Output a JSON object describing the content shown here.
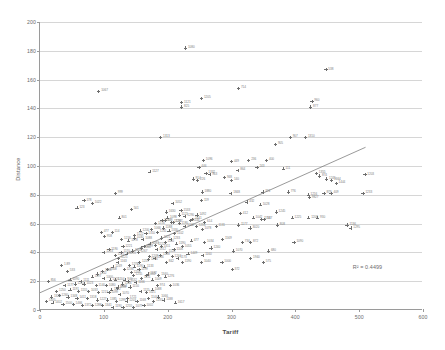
{
  "chart_data": {
    "type": "scatter",
    "title": "",
    "xlabel": "Tariff",
    "ylabel": "Distance",
    "xlim": [
      0,
      600
    ],
    "ylim": [
      0,
      200
    ],
    "xticks": [
      0,
      100,
      200,
      300,
      400,
      500,
      600
    ],
    "yticks": [
      0,
      20,
      40,
      60,
      80,
      100,
      120,
      140,
      160,
      180,
      200
    ],
    "grid": "horizontal",
    "legend": "none",
    "annotations": [
      {
        "name": "r-squared",
        "text": "R² = 0.4499",
        "x": 490,
        "y": 32
      }
    ],
    "trendline": {
      "type": "linear",
      "x0": 0,
      "y0": 12,
      "x1": 510,
      "y1": 113,
      "color": "#6e6e6e"
    },
    "marker": {
      "shape": "plus",
      "color": "#6e6e6e",
      "size": 3.2
    },
    "point_labels_visible": true,
    "points": [
      {
        "x": 228,
        "y": 182,
        "label": "1080"
      },
      {
        "x": 448,
        "y": 167,
        "label": "538"
      },
      {
        "x": 92,
        "y": 152,
        "label": "1067"
      },
      {
        "x": 311,
        "y": 154,
        "label": "714"
      },
      {
        "x": 426,
        "y": 145,
        "label": "960"
      },
      {
        "x": 424,
        "y": 141,
        "label": "877"
      },
      {
        "x": 253,
        "y": 147,
        "label": "1205"
      },
      {
        "x": 222,
        "y": 144,
        "label": "1121"
      },
      {
        "x": 222,
        "y": 141,
        "label": "825"
      },
      {
        "x": 189,
        "y": 120,
        "label": "1313"
      },
      {
        "x": 392,
        "y": 120,
        "label": "907"
      },
      {
        "x": 416,
        "y": 120,
        "label": "1310"
      },
      {
        "x": 369,
        "y": 115,
        "label": "905"
      },
      {
        "x": 256,
        "y": 104,
        "label": "1096"
      },
      {
        "x": 300,
        "y": 103,
        "label": "449"
      },
      {
        "x": 327,
        "y": 104,
        "label": "236"
      },
      {
        "x": 355,
        "y": 104,
        "label": "400"
      },
      {
        "x": 172,
        "y": 96,
        "label": "1127"
      },
      {
        "x": 249,
        "y": 99,
        "label": "446"
      },
      {
        "x": 310,
        "y": 97,
        "label": "864"
      },
      {
        "x": 340,
        "y": 99,
        "label": "243"
      },
      {
        "x": 381,
        "y": 98,
        "label": "111"
      },
      {
        "x": 260,
        "y": 95,
        "label": "1332"
      },
      {
        "x": 266,
        "y": 94,
        "label": "963"
      },
      {
        "x": 289,
        "y": 92,
        "label": "948"
      },
      {
        "x": 240,
        "y": 91,
        "label": "914"
      },
      {
        "x": 247,
        "y": 90,
        "label": "226"
      },
      {
        "x": 300,
        "y": 90,
        "label": "140"
      },
      {
        "x": 433,
        "y": 95,
        "label": "1355"
      },
      {
        "x": 438,
        "y": 93,
        "label": "874"
      },
      {
        "x": 449,
        "y": 91,
        "label": "1245"
      },
      {
        "x": 457,
        "y": 90,
        "label": "1664"
      },
      {
        "x": 464,
        "y": 88,
        "label": "1444"
      },
      {
        "x": 509,
        "y": 94,
        "label": "1203"
      },
      {
        "x": 118,
        "y": 81,
        "label": "999"
      },
      {
        "x": 254,
        "y": 82,
        "label": "1880"
      },
      {
        "x": 299,
        "y": 81,
        "label": "1848"
      },
      {
        "x": 349,
        "y": 82,
        "label": "374"
      },
      {
        "x": 389,
        "y": 82,
        "label": "776"
      },
      {
        "x": 420,
        "y": 80,
        "label": "1216"
      },
      {
        "x": 445,
        "y": 81,
        "label": "879"
      },
      {
        "x": 456,
        "y": 81,
        "label": "409"
      },
      {
        "x": 422,
        "y": 78,
        "label": "9827"
      },
      {
        "x": 506,
        "y": 81,
        "label": "1233"
      },
      {
        "x": 69,
        "y": 76,
        "label": "178"
      },
      {
        "x": 82,
        "y": 74,
        "label": "1022"
      },
      {
        "x": 58,
        "y": 71,
        "label": "123"
      },
      {
        "x": 208,
        "y": 74,
        "label": "1052"
      },
      {
        "x": 253,
        "y": 76,
        "label": "119"
      },
      {
        "x": 324,
        "y": 75,
        "label": "432"
      },
      {
        "x": 345,
        "y": 73,
        "label": "1028"
      },
      {
        "x": 143,
        "y": 70,
        "label": "501"
      },
      {
        "x": 198,
        "y": 68,
        "label": "1630"
      },
      {
        "x": 221,
        "y": 69,
        "label": "1533"
      },
      {
        "x": 246,
        "y": 66,
        "label": "1492"
      },
      {
        "x": 314,
        "y": 67,
        "label": "412"
      },
      {
        "x": 370,
        "y": 68,
        "label": "1245"
      },
      {
        "x": 124,
        "y": 64,
        "label": "801"
      },
      {
        "x": 196,
        "y": 62,
        "label": "478"
      },
      {
        "x": 206,
        "y": 61,
        "label": "1226"
      },
      {
        "x": 239,
        "y": 63,
        "label": "1441"
      },
      {
        "x": 258,
        "y": 61,
        "label": "614"
      },
      {
        "x": 334,
        "y": 64,
        "label": "1042"
      },
      {
        "x": 347,
        "y": 63,
        "label": "1134"
      },
      {
        "x": 352,
        "y": 63,
        "label": "537"
      },
      {
        "x": 395,
        "y": 64,
        "label": "1225"
      },
      {
        "x": 421,
        "y": 64,
        "label": "1208"
      },
      {
        "x": 435,
        "y": 64,
        "label": "930"
      },
      {
        "x": 276,
        "y": 58,
        "label": "1131"
      },
      {
        "x": 311,
        "y": 59,
        "label": "1177"
      },
      {
        "x": 329,
        "y": 57,
        "label": "3020"
      },
      {
        "x": 372,
        "y": 59,
        "label": "808"
      },
      {
        "x": 481,
        "y": 59,
        "label": "1136"
      },
      {
        "x": 487,
        "y": 57,
        "label": "1295"
      },
      {
        "x": 96,
        "y": 54,
        "label": "477"
      },
      {
        "x": 113,
        "y": 54,
        "label": "114"
      },
      {
        "x": 101,
        "y": 51,
        "label": "958"
      },
      {
        "x": 128,
        "y": 49,
        "label": "1216"
      },
      {
        "x": 148,
        "y": 50,
        "label": "1030"
      },
      {
        "x": 161,
        "y": 49,
        "label": "1088"
      },
      {
        "x": 190,
        "y": 50,
        "label": "1221"
      },
      {
        "x": 237,
        "y": 48,
        "label": "477"
      },
      {
        "x": 258,
        "y": 47,
        "label": "1034"
      },
      {
        "x": 286,
        "y": 49,
        "label": "1569"
      },
      {
        "x": 317,
        "y": 47,
        "label": "734"
      },
      {
        "x": 330,
        "y": 47,
        "label": "872"
      },
      {
        "x": 398,
        "y": 47,
        "label": "1090"
      },
      {
        "x": 130,
        "y": 44,
        "label": "1221"
      },
      {
        "x": 159,
        "y": 43,
        "label": "1060"
      },
      {
        "x": 183,
        "y": 42,
        "label": "1312"
      },
      {
        "x": 210,
        "y": 42,
        "label": "1106"
      },
      {
        "x": 268,
        "y": 43,
        "label": "1240"
      },
      {
        "x": 303,
        "y": 41,
        "label": "1070"
      },
      {
        "x": 358,
        "y": 41,
        "label": "680"
      },
      {
        "x": 232,
        "y": 39,
        "label": "1449"
      },
      {
        "x": 255,
        "y": 38,
        "label": "1160"
      },
      {
        "x": 330,
        "y": 36,
        "label": "1940"
      },
      {
        "x": 123,
        "y": 36,
        "label": "1125"
      },
      {
        "x": 170,
        "y": 35,
        "label": "1216"
      },
      {
        "x": 198,
        "y": 33,
        "label": "842"
      },
      {
        "x": 223,
        "y": 33,
        "label": "1190"
      },
      {
        "x": 253,
        "y": 33,
        "label": "1040"
      },
      {
        "x": 285,
        "y": 33,
        "label": "1000"
      },
      {
        "x": 350,
        "y": 33,
        "label": "575"
      },
      {
        "x": 301,
        "y": 28,
        "label": "372"
      },
      {
        "x": 143,
        "y": 26,
        "label": "1209"
      },
      {
        "x": 169,
        "y": 25,
        "label": "1182"
      },
      {
        "x": 196,
        "y": 23,
        "label": "1276"
      },
      {
        "x": 204,
        "y": 17,
        "label": "1036"
      },
      {
        "x": 137,
        "y": 8,
        "label": "1721"
      },
      {
        "x": 212,
        "y": 5,
        "label": "1617"
      },
      {
        "x": 34,
        "y": 31,
        "label": "1.89"
      },
      {
        "x": 43,
        "y": 27,
        "label": "533"
      },
      {
        "x": 13,
        "y": 20,
        "label": "856"
      },
      {
        "x": 100,
        "y": 22,
        "label": "1000"
      },
      {
        "x": 110,
        "y": 21,
        "label": "1120"
      },
      {
        "x": 118,
        "y": 21,
        "label": "1204"
      },
      {
        "x": 133,
        "y": 21,
        "label": "940"
      },
      {
        "x": 69,
        "y": 18,
        "label": "1023"
      },
      {
        "x": 88,
        "y": 17,
        "label": "1140"
      },
      {
        "x": 104,
        "y": 17,
        "label": "1080"
      },
      {
        "x": 122,
        "y": 16,
        "label": "1244"
      },
      {
        "x": 141,
        "y": 16,
        "label": "1150"
      },
      {
        "x": 47,
        "y": 14,
        "label": "1191"
      },
      {
        "x": 60,
        "y": 13,
        "label": "1155"
      },
      {
        "x": 76,
        "y": 13,
        "label": "1033"
      },
      {
        "x": 92,
        "y": 12,
        "label": "1213"
      },
      {
        "x": 108,
        "y": 12,
        "label": "1099"
      },
      {
        "x": 125,
        "y": 11,
        "label": "1070"
      },
      {
        "x": 30,
        "y": 10,
        "label": "1260"
      },
      {
        "x": 44,
        "y": 9,
        "label": "1348"
      },
      {
        "x": 58,
        "y": 8,
        "label": "1411"
      },
      {
        "x": 74,
        "y": 8,
        "label": "1318"
      },
      {
        "x": 90,
        "y": 7,
        "label": "1227"
      },
      {
        "x": 106,
        "y": 7,
        "label": "1385"
      },
      {
        "x": 120,
        "y": 6,
        "label": "1299"
      },
      {
        "x": 136,
        "y": 6,
        "label": "1203"
      },
      {
        "x": 152,
        "y": 6,
        "label": "1168"
      },
      {
        "x": 20,
        "y": 5,
        "label": "1402"
      },
      {
        "x": 36,
        "y": 4,
        "label": "1500"
      },
      {
        "x": 52,
        "y": 4,
        "label": "1466"
      },
      {
        "x": 66,
        "y": 3,
        "label": "1372"
      },
      {
        "x": 82,
        "y": 3,
        "label": "1288"
      },
      {
        "x": 98,
        "y": 3,
        "label": "1341"
      },
      {
        "x": 114,
        "y": 2,
        "label": "1190"
      },
      {
        "x": 130,
        "y": 2,
        "label": "1255"
      },
      {
        "x": 146,
        "y": 2,
        "label": "1077"
      },
      {
        "x": 163,
        "y": 3,
        "label": "1002"
      },
      {
        "x": 158,
        "y": 13,
        "label": "1115"
      },
      {
        "x": 167,
        "y": 12,
        "label": "1021"
      },
      {
        "x": 176,
        "y": 14,
        "label": "1088"
      },
      {
        "x": 184,
        "y": 17,
        "label": "974"
      },
      {
        "x": 150,
        "y": 19,
        "label": "1166"
      },
      {
        "x": 159,
        "y": 22,
        "label": "1131"
      },
      {
        "x": 167,
        "y": 24,
        "label": "1052"
      },
      {
        "x": 176,
        "y": 21,
        "label": "1009"
      },
      {
        "x": 186,
        "y": 24,
        "label": "1340"
      },
      {
        "x": 132,
        "y": 28,
        "label": "1236"
      },
      {
        "x": 140,
        "y": 31,
        "label": "1278"
      },
      {
        "x": 148,
        "y": 30,
        "label": "1190"
      },
      {
        "x": 156,
        "y": 33,
        "label": "1219"
      },
      {
        "x": 164,
        "y": 30,
        "label": "1133"
      },
      {
        "x": 122,
        "y": 33,
        "label": "1163"
      },
      {
        "x": 114,
        "y": 30,
        "label": "1249"
      },
      {
        "x": 106,
        "y": 28,
        "label": "1308"
      },
      {
        "x": 98,
        "y": 27,
        "label": "1188"
      },
      {
        "x": 90,
        "y": 25,
        "label": "1242"
      },
      {
        "x": 82,
        "y": 23,
        "label": "1197"
      },
      {
        "x": 118,
        "y": 38,
        "label": "1221"
      },
      {
        "x": 127,
        "y": 40,
        "label": "1170"
      },
      {
        "x": 136,
        "y": 39,
        "label": "1255"
      },
      {
        "x": 145,
        "y": 41,
        "label": "1144"
      },
      {
        "x": 154,
        "y": 40,
        "label": "1267"
      },
      {
        "x": 163,
        "y": 44,
        "label": "1199"
      },
      {
        "x": 172,
        "y": 46,
        "label": "1083"
      },
      {
        "x": 181,
        "y": 45,
        "label": "1222"
      },
      {
        "x": 190,
        "y": 44,
        "label": "1311"
      },
      {
        "x": 108,
        "y": 42,
        "label": "1190"
      },
      {
        "x": 100,
        "y": 40,
        "label": "1233"
      },
      {
        "x": 139,
        "y": 48,
        "label": "1178"
      },
      {
        "x": 148,
        "y": 52,
        "label": "1122"
      },
      {
        "x": 157,
        "y": 55,
        "label": "1200"
      },
      {
        "x": 166,
        "y": 53,
        "label": "1310"
      },
      {
        "x": 175,
        "y": 56,
        "label": "1066"
      },
      {
        "x": 184,
        "y": 54,
        "label": "1241"
      },
      {
        "x": 193,
        "y": 57,
        "label": "1188"
      },
      {
        "x": 202,
        "y": 55,
        "label": "1330"
      },
      {
        "x": 211,
        "y": 53,
        "label": "1102"
      },
      {
        "x": 181,
        "y": 60,
        "label": "1216"
      },
      {
        "x": 191,
        "y": 62,
        "label": "1155"
      },
      {
        "x": 200,
        "y": 64,
        "label": "1098"
      },
      {
        "x": 209,
        "y": 61,
        "label": "1287"
      },
      {
        "x": 218,
        "y": 60,
        "label": "1180"
      },
      {
        "x": 227,
        "y": 58,
        "label": "1242"
      },
      {
        "x": 218,
        "y": 66,
        "label": "1121"
      },
      {
        "x": 227,
        "y": 65,
        "label": "1290"
      },
      {
        "x": 236,
        "y": 62,
        "label": "1144"
      },
      {
        "x": 245,
        "y": 58,
        "label": "1216"
      },
      {
        "x": 254,
        "y": 56,
        "label": "1078"
      },
      {
        "x": 196,
        "y": 47,
        "label": "1140"
      },
      {
        "x": 205,
        "y": 49,
        "label": "1233"
      },
      {
        "x": 214,
        "y": 46,
        "label": "1190"
      },
      {
        "x": 223,
        "y": 44,
        "label": "1055"
      },
      {
        "x": 171,
        "y": 37,
        "label": "1209"
      },
      {
        "x": 180,
        "y": 36,
        "label": "1166"
      },
      {
        "x": 189,
        "y": 38,
        "label": "1288"
      },
      {
        "x": 198,
        "y": 40,
        "label": "1120"
      },
      {
        "x": 207,
        "y": 37,
        "label": "1244"
      },
      {
        "x": 216,
        "y": 36,
        "label": "1173"
      },
      {
        "x": 155,
        "y": 28,
        "label": "1199"
      },
      {
        "x": 146,
        "y": 24,
        "label": "1255"
      },
      {
        "x": 138,
        "y": 20,
        "label": "1132"
      },
      {
        "x": 129,
        "y": 18,
        "label": "1266"
      },
      {
        "x": 121,
        "y": 15,
        "label": "1188"
      },
      {
        "x": 112,
        "y": 14,
        "label": "1242"
      },
      {
        "x": 64,
        "y": 20,
        "label": "1111"
      },
      {
        "x": 55,
        "y": 18,
        "label": "1222"
      },
      {
        "x": 47,
        "y": 21,
        "label": "1090"
      },
      {
        "x": 39,
        "y": 17,
        "label": "1177"
      },
      {
        "x": 26,
        "y": 13,
        "label": "1250"
      },
      {
        "x": 18,
        "y": 9,
        "label": "1320"
      },
      {
        "x": 10,
        "y": 6,
        "label": "1405"
      },
      {
        "x": 170,
        "y": 8,
        "label": "1144"
      },
      {
        "x": 178,
        "y": 6,
        "label": "1233"
      },
      {
        "x": 186,
        "y": 9,
        "label": "1066"
      },
      {
        "x": 194,
        "y": 7,
        "label": "1188"
      }
    ]
  }
}
